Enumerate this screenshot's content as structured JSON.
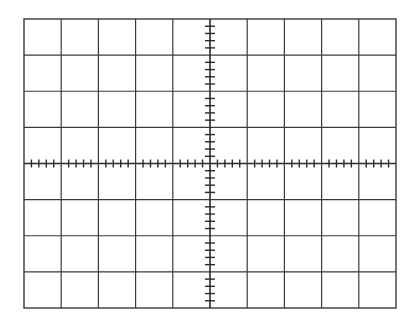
{
  "graticule": {
    "title": "Oscilloscope graticule",
    "columns": 10,
    "rows": 8,
    "minor_divisions_per_major": 5,
    "frame": {
      "left": 24,
      "top": 19,
      "right": 396,
      "bottom": 308
    },
    "colors": {
      "background": "#ffffff",
      "grid_line": "#3a3a3a",
      "axis_line": "#2a2a2a",
      "tick": "#2a2a2a"
    }
  }
}
